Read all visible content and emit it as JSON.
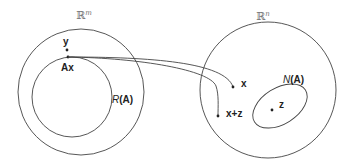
{
  "colors": {
    "stroke": "#444444",
    "text": "#222222",
    "space_label": "#777777"
  },
  "domain_space": {
    "label_base": "ℝ",
    "label_sup": "m",
    "range_label_func": "R",
    "range_label_arg": "(A)",
    "points": {
      "y": "y",
      "ax": "Ax"
    }
  },
  "codomain_space": {
    "label_base": "ℝ",
    "label_sup": "n",
    "nullspace_label_func": "N",
    "nullspace_label_arg": "(A)",
    "points": {
      "x": "x",
      "x_plus_z": "x+z",
      "z": "z"
    }
  }
}
